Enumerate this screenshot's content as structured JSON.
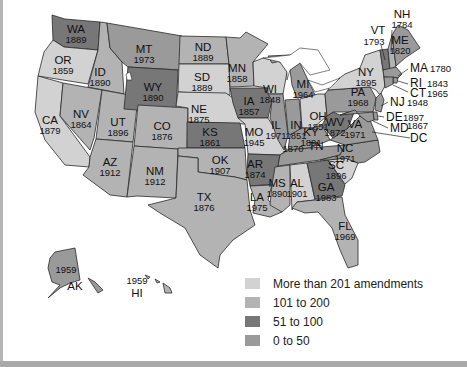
{
  "colors": {
    "more_than_201": "#d2d2d2",
    "101_to_200": "#b3b3b3",
    "51_to_100": "#777777",
    "0_to_50": "#9a9a9a",
    "background": "#ffffff",
    "border": "#2a2a2a"
  },
  "states": {
    "WA": {
      "abbr": "WA",
      "year": "1889",
      "category": "51_to_100"
    },
    "OR": {
      "abbr": "OR",
      "year": "1859",
      "category": "more_than_201"
    },
    "CA": {
      "abbr": "CA",
      "year": "1879",
      "category": "more_than_201"
    },
    "ID": {
      "abbr": "ID",
      "year": "1890",
      "category": "101_to_200"
    },
    "NV": {
      "abbr": "NV",
      "year": "1864",
      "category": "101_to_200"
    },
    "UT": {
      "abbr": "UT",
      "year": "1896",
      "category": "101_to_200"
    },
    "AZ": {
      "abbr": "AZ",
      "year": "1912",
      "category": "101_to_200"
    },
    "MT": {
      "abbr": "MT",
      "year": "1973",
      "category": "0_to_50"
    },
    "WY": {
      "abbr": "WY",
      "year": "1890",
      "category": "51_to_100"
    },
    "CO": {
      "abbr": "CO",
      "year": "1876",
      "category": "101_to_200"
    },
    "NM": {
      "abbr": "NM",
      "year": "1912",
      "category": "101_to_200"
    },
    "ND": {
      "abbr": "ND",
      "year": "1889",
      "category": "101_to_200"
    },
    "SD": {
      "abbr": "SD",
      "year": "1889",
      "category": "more_than_201"
    },
    "NE": {
      "abbr": "NE",
      "year": "1875",
      "category": "more_than_201"
    },
    "KS": {
      "abbr": "KS",
      "year": "1861",
      "category": "51_to_100"
    },
    "OK": {
      "abbr": "OK",
      "year": "1907",
      "category": "101_to_200"
    },
    "TX": {
      "abbr": "TX",
      "year": "1876",
      "category": "101_to_200"
    },
    "MN": {
      "abbr": "MN",
      "year": "1858",
      "category": "101_to_200"
    },
    "IA": {
      "abbr": "IA",
      "year": "1857",
      "category": "51_to_100"
    },
    "MO": {
      "abbr": "MO",
      "year": "1945",
      "category": "more_than_201"
    },
    "AR": {
      "abbr": "AR",
      "year": "1874",
      "category": "51_to_100"
    },
    "LA": {
      "abbr": "LA",
      "year": "1975",
      "category": "101_to_200"
    },
    "WI": {
      "abbr": "WI",
      "year": "1848",
      "category": "more_than_201"
    },
    "IL": {
      "abbr": "IL",
      "year": "1971",
      "category": "0_to_50"
    },
    "MI": {
      "abbr": "MI",
      "year": "1964",
      "category": "0_to_50"
    },
    "IN": {
      "abbr": "IN",
      "year": "1851",
      "category": "0_to_50"
    },
    "OH": {
      "abbr": "OH",
      "year": "1851",
      "category": "more_than_201"
    },
    "KY": {
      "abbr": "KY",
      "year": "1891",
      "category": "0_to_50"
    },
    "TN": {
      "abbr": "TN",
      "year": "1870",
      "category": "0_to_50"
    },
    "MS": {
      "abbr": "MS",
      "year": "1890",
      "category": "101_to_200"
    },
    "AL": {
      "abbr": "AL",
      "year": "1901",
      "category": "more_than_201"
    },
    "GA": {
      "abbr": "GA",
      "year": "1983",
      "category": "51_to_100"
    },
    "FL": {
      "abbr": "FL",
      "year": "1969",
      "category": "101_to_200"
    },
    "SC": {
      "abbr": "SC",
      "year": "1896",
      "category": "more_than_201"
    },
    "NC": {
      "abbr": "NC",
      "year": "1971",
      "category": "0_to_50"
    },
    "VA": {
      "abbr": "VA",
      "year": "1971",
      "category": "0_to_50"
    },
    "WV": {
      "abbr": "WV",
      "year": "1872",
      "category": "51_to_100"
    },
    "PA": {
      "abbr": "PA",
      "year": "1968",
      "category": "0_to_50"
    },
    "NY": {
      "abbr": "NY",
      "year": "1895",
      "category": "more_than_201"
    },
    "VT": {
      "abbr": "VT",
      "year": "1793",
      "category": "51_to_100"
    },
    "NH": {
      "abbr": "NH",
      "year": "1784",
      "category": "101_to_200"
    },
    "ME": {
      "abbr": "ME",
      "year": "1820",
      "category": "0_to_50"
    },
    "MA": {
      "abbr": "MA",
      "year": "1780",
      "category": "0_to_50"
    },
    "RI": {
      "abbr": "RI",
      "year": "1843",
      "category": "0_to_50"
    },
    "CT": {
      "abbr": "CT",
      "year": "1965",
      "category": "0_to_50"
    },
    "NJ": {
      "abbr": "NJ",
      "year": "1948",
      "category": "0_to_50"
    },
    "DE": {
      "abbr": "DE",
      "year": "1897",
      "category": "0_to_50"
    },
    "MD": {
      "abbr": "MD",
      "year": "1867",
      "category": "0_to_50"
    },
    "DC": {
      "abbr": "DC",
      "year": "",
      "category": "101_to_200"
    },
    "AK": {
      "abbr": "AK",
      "year": "1959",
      "category": "0_to_50"
    },
    "HI": {
      "abbr": "HI",
      "year": "1959",
      "category": "101_to_200"
    }
  },
  "legend": {
    "items": [
      {
        "label": "More than 201 amendments",
        "key": "more_than_201"
      },
      {
        "label": "101 to 200",
        "key": "101_to_200"
      },
      {
        "label": "51 to 100",
        "key": "51_to_100"
      },
      {
        "label": "0 to 50",
        "key": "0_to_50"
      }
    ]
  }
}
